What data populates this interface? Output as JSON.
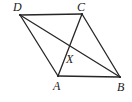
{
  "figure": {
    "kind": "geometry-diagram",
    "background_color": "#ffffff",
    "stroke_color": "#262626",
    "label_color": "#1a1a1a",
    "stroke_width": 1.3,
    "canvas": {
      "width": 132,
      "height": 102
    }
  },
  "points": {
    "A": {
      "label": "A",
      "x": 58,
      "y": 76,
      "label_x": 53,
      "label_y": 80
    },
    "B": {
      "label": "B",
      "x": 120,
      "y": 77,
      "label_x": 117,
      "label_y": 81
    },
    "C": {
      "label": "C",
      "x": 82,
      "y": 14,
      "label_x": 77,
      "label_y": 1
    },
    "D": {
      "label": "D",
      "x": 20,
      "y": 15,
      "label_x": 13,
      "label_y": 1
    },
    "X": {
      "label": "X",
      "x": 68,
      "y": 50,
      "label_x": 66,
      "label_y": 53
    }
  },
  "segments": [
    {
      "name": "side-DC",
      "from": "D",
      "to": "C"
    },
    {
      "name": "side-CB",
      "from": "C",
      "to": "B"
    },
    {
      "name": "side-AB",
      "from": "A",
      "to": "B"
    },
    {
      "name": "side-DA",
      "from": "D",
      "to": "A"
    },
    {
      "name": "diagonal-DB",
      "from": "D",
      "to": "B"
    },
    {
      "name": "diagonal-AC",
      "from": "A",
      "to": "C"
    }
  ]
}
